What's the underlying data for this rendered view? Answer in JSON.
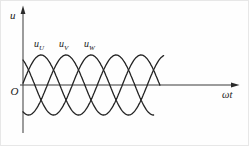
{
  "chart_data": {
    "type": "line",
    "title": "",
    "xlabel": "ωt",
    "ylabel": "u",
    "origin_label": "O",
    "period_deg": 360,
    "x_range_deg": [
      0,
      680
    ],
    "ylim": [
      -1,
      1
    ],
    "grid": false,
    "legend": "inline-labels-above-first-peaks",
    "series": [
      {
        "id": "uU",
        "name": "u_U",
        "label_base": "u",
        "label_sub": "U",
        "phase_deg": 0,
        "amplitude": 1,
        "theta_start_deg": 3.4,
        "theta_end_deg": 632
      },
      {
        "id": "uV",
        "name": "u_V",
        "label_base": "u",
        "label_sub": "V",
        "phase_deg": -120,
        "amplitude": 1,
        "theta_start_deg": 3.4,
        "theta_end_deg": 661
      },
      {
        "id": "uW",
        "name": "u_W",
        "label_base": "u",
        "label_sub": "W",
        "phase_deg": 120,
        "amplitude": 1,
        "theta_start_deg": 3.4,
        "theta_end_deg": 680
      }
    ],
    "layout": {
      "zero_x_px": 21.3,
      "axis_y_px": 84,
      "period_px": 75,
      "amplitude_px": 30,
      "ink_color": "#232323"
    }
  }
}
